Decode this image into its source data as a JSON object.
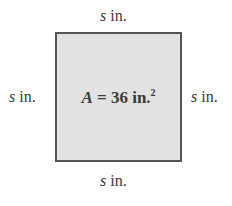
{
  "diagram": {
    "shape": "square",
    "fill_color": "#e2e2e2",
    "border_color": "#555555",
    "area_label": {
      "variable": "A",
      "equals": " = 36 in.",
      "exponent": "2"
    },
    "side_labels": {
      "top": {
        "variable": "s",
        "unit": " in."
      },
      "left": {
        "variable": "s",
        "unit": " in."
      },
      "right": {
        "variable": "s",
        "unit": " in."
      },
      "bottom": {
        "variable": "s",
        "unit": " in."
      }
    }
  }
}
